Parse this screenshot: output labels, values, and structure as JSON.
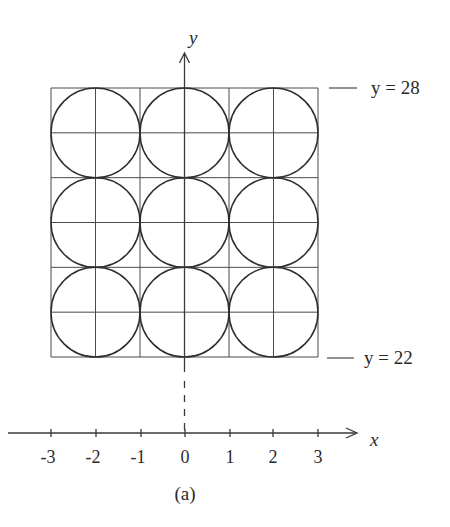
{
  "figure": {
    "caption": "(a)",
    "line_color": "#3a3a3a",
    "circle_color": "#2e2e2e",
    "grid_color": "#4a4a4a"
  },
  "axes": {
    "x_label": "x",
    "y_label": "y",
    "x_ticks": [
      "-3",
      "-2",
      "-1",
      "0",
      "1",
      "2",
      "3"
    ],
    "x_tick_values": [
      -3,
      -2,
      -1,
      0,
      1,
      2,
      3
    ]
  },
  "annotations": {
    "top": "y = 28",
    "bottom": "y = 22"
  },
  "grid": {
    "rows": 3,
    "cols": 3,
    "subdivisions_per_cell": 2,
    "x_range": [
      -3,
      3
    ],
    "y_range": [
      22,
      28
    ]
  },
  "circles": [
    {
      "row": 0,
      "col": 0
    },
    {
      "row": 0,
      "col": 1
    },
    {
      "row": 0,
      "col": 2
    },
    {
      "row": 1,
      "col": 0
    },
    {
      "row": 1,
      "col": 1
    },
    {
      "row": 1,
      "col": 2
    },
    {
      "row": 2,
      "col": 0
    },
    {
      "row": 2,
      "col": 1
    },
    {
      "row": 2,
      "col": 2
    }
  ]
}
